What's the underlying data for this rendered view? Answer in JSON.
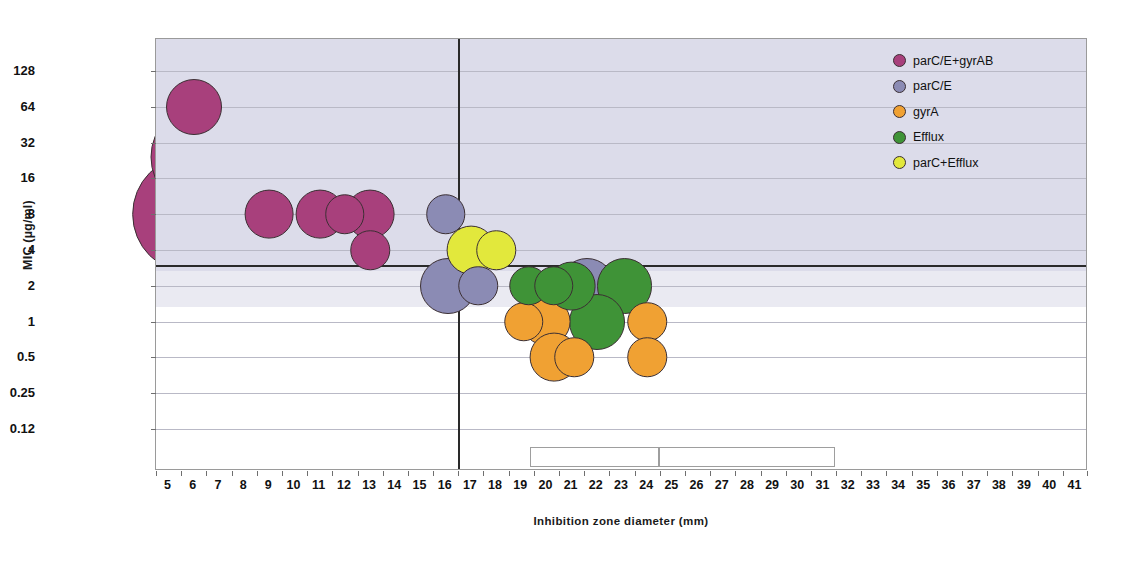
{
  "chart_data": {
    "type": "scatter",
    "title": "",
    "xlabel": "Inhibition zone diameter (mm)",
    "ylabel": "MIC (µg/ml)",
    "xlim": [
      5,
      41
    ],
    "ylim": [
      0.12,
      128
    ],
    "yscale": "log2",
    "grid": true,
    "legend_position": "top-right",
    "x_ticklabels": [
      "5",
      "6",
      "7",
      "8",
      "9",
      "10",
      "11",
      "12",
      "13",
      "14",
      "15",
      "16",
      "17",
      "18",
      "19",
      "20",
      "21",
      "22",
      "23",
      "24",
      "25",
      "26",
      "27",
      "28",
      "29",
      "30",
      "31",
      "32",
      "33",
      "34",
      "35",
      "36",
      "37",
      "38",
      "39",
      "40",
      "41"
    ],
    "y_ticklabels": [
      "128",
      "64",
      "32",
      "16",
      "8",
      "4",
      "2",
      "1",
      "0.5",
      "0.25",
      "0.12"
    ],
    "y_tickvalues": [
      128,
      64,
      32,
      16,
      8,
      4,
      2,
      1,
      0.5,
      0.25,
      0.12
    ],
    "reference_lines": {
      "horizontal_mic_breakpoint": 3,
      "vertical_zone_breakpoint": 16.5
    },
    "series": [
      {
        "name": "parC/E+gyrAB",
        "color": "#a8407c",
        "points": [
          {
            "x": 6.0,
            "y": 64,
            "n": 3
          },
          {
            "x": 6.4,
            "y": 24,
            "n": 16
          },
          {
            "x": 5.9,
            "y": 8,
            "n": 20
          },
          {
            "x": 9.0,
            "y": 8,
            "n": 2
          },
          {
            "x": 11.0,
            "y": 8,
            "n": 2
          },
          {
            "x": 12.0,
            "y": 8,
            "n": 1
          },
          {
            "x": 13.0,
            "y": 8,
            "n": 2
          },
          {
            "x": 13.0,
            "y": 4,
            "n": 1
          }
        ]
      },
      {
        "name": "parC/E",
        "color": "#8b8bb4",
        "points": [
          {
            "x": 16.0,
            "y": 8,
            "n": 1
          },
          {
            "x": 16.1,
            "y": 2,
            "n": 3
          },
          {
            "x": 17.3,
            "y": 2,
            "n": 1
          },
          {
            "x": 19.6,
            "y": 2.6,
            "n": 6
          },
          {
            "x": 20.9,
            "y": 2.4,
            "n": 5
          },
          {
            "x": 21.6,
            "y": 2,
            "n": 3
          }
        ]
      },
      {
        "name": "gyrA",
        "color": "#f0a133",
        "points": [
          {
            "x": 18.4,
            "y": 2,
            "n": 5
          },
          {
            "x": 19.1,
            "y": 1,
            "n": 1
          },
          {
            "x": 20.0,
            "y": 1,
            "n": 2
          },
          {
            "x": 20.3,
            "y": 0.5,
            "n": 2
          },
          {
            "x": 21.1,
            "y": 0.5,
            "n": 1
          },
          {
            "x": 24.0,
            "y": 1,
            "n": 1
          },
          {
            "x": 24.0,
            "y": 0.5,
            "n": 1
          }
        ]
      },
      {
        "name": "Efflux",
        "color": "#3f9337",
        "points": [
          {
            "x": 19.3,
            "y": 2,
            "n": 1
          },
          {
            "x": 20.3,
            "y": 2,
            "n": 1
          },
          {
            "x": 21.0,
            "y": 2,
            "n": 2
          },
          {
            "x": 22.0,
            "y": 2,
            "n": 4
          },
          {
            "x": 23.1,
            "y": 2,
            "n": 3
          },
          {
            "x": 22.0,
            "y": 1,
            "n": 3
          }
        ]
      },
      {
        "name": "parC+Efflux",
        "color": "#e2e83c",
        "points": [
          {
            "x": 17.0,
            "y": 4,
            "n": 2
          },
          {
            "x": 18.0,
            "y": 4,
            "n": 1
          }
        ]
      }
    ],
    "annotation_boxes": [
      {
        "x_start": 19.4,
        "x_end": 24.5
      },
      {
        "x_start": 24.5,
        "x_end": 31.5
      }
    ]
  },
  "legend": {
    "items": [
      {
        "label": "parC/E+gyrAB",
        "color": "#a8407c"
      },
      {
        "label": "parC/E",
        "color": "#8b8bb4"
      },
      {
        "label": "gyrA",
        "color": "#f0a133"
      },
      {
        "label": "Efflux",
        "color": "#3f9337"
      },
      {
        "label": "parC+Efflux",
        "color": "#e2e83c"
      }
    ]
  }
}
